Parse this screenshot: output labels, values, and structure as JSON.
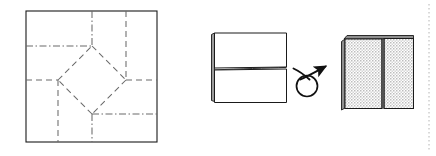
{
  "figure": {
    "type": "origami-fold-diagram",
    "width": 436,
    "height": 156,
    "background_color": "#ffffff",
    "line_color": "#1a1a1a",
    "fold_line_color": "#555555",
    "shaded_fill_color": "#d8d8d8",
    "panels": [
      {
        "id": "crease-pattern",
        "name": "Crease pattern square",
        "shape": "square",
        "outline": {
          "x": 26,
          "y": 11,
          "width": 131,
          "height": 131
        },
        "creases": [
          {
            "name": "top-vertical-mountain",
            "style": "dash-dot",
            "from": [
              92,
              11
            ],
            "to": [
              92,
              46
            ]
          },
          {
            "name": "left-horizontal-mountain",
            "style": "dash-dot",
            "from": [
              26,
              46
            ],
            "to": [
              92,
              46
            ]
          },
          {
            "name": "right-vertical-valley",
            "style": "dashed",
            "from": [
              126,
              11
            ],
            "to": [
              126,
              80
            ]
          },
          {
            "name": "right-horizontal-valley",
            "style": "dashed",
            "from": [
              126,
              80
            ],
            "to": [
              157,
              80
            ]
          },
          {
            "name": "left-horizontal-valley",
            "style": "dashed",
            "from": [
              26,
              80
            ],
            "to": [
              58,
              80
            ]
          },
          {
            "name": "left-vertical-valley",
            "style": "dashed",
            "from": [
              58,
              80
            ],
            "to": [
              58,
              142
            ]
          },
          {
            "name": "bottom-vertical-mountain",
            "style": "dash-dot",
            "from": [
              92,
              114
            ],
            "to": [
              92,
              142
            ]
          },
          {
            "name": "bottom-horizontal-mountain",
            "style": "dash-dot",
            "from": [
              92,
              114
            ],
            "to": [
              157,
              114
            ]
          },
          {
            "name": "diamond-top-right",
            "style": "dashed",
            "from": [
              92,
              46
            ],
            "to": [
              126,
              80
            ]
          },
          {
            "name": "diamond-right-bottom",
            "style": "dashed",
            "from": [
              126,
              80
            ],
            "to": [
              92,
              114
            ]
          },
          {
            "name": "diamond-bottom-left",
            "style": "dashed",
            "from": [
              92,
              114
            ],
            "to": [
              58,
              80
            ]
          },
          {
            "name": "diamond-left-top",
            "style": "dashed",
            "from": [
              58,
              80
            ],
            "to": [
              92,
              46
            ]
          }
        ]
      },
      {
        "id": "folded-front",
        "name": "Folded rectangle front view",
        "outline": {
          "x": 214,
          "y": 32,
          "width": 72,
          "height": 70
        },
        "divider_y": 68,
        "spine": {
          "x": 211,
          "y": 34,
          "width": 4,
          "height": 68
        }
      },
      {
        "id": "turn-over-arrow",
        "name": "Turn over arrow",
        "loop_center": [
          307,
          85
        ],
        "loop_radius": 10,
        "arrow_tip": [
          333,
          64
        ]
      },
      {
        "id": "folded-back",
        "name": "Shaded folded rectangle back view",
        "outline": {
          "x": 345,
          "y": 36,
          "width": 68,
          "height": 73
        },
        "divider_x": 383,
        "fill": "stipple-gray"
      },
      {
        "id": "page-margin",
        "name": "Dotted page margin rule",
        "style": "dotted",
        "from": [
          429,
          4
        ],
        "to": [
          429,
          152
        ]
      }
    ]
  }
}
